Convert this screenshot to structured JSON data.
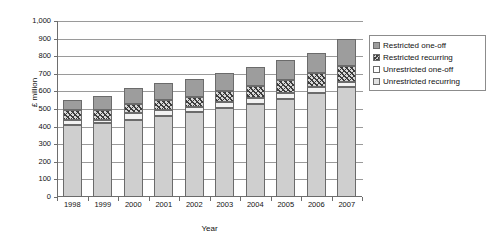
{
  "chart_data": {
    "type": "bar",
    "subtype": "stacked-bar",
    "title": "",
    "xlabel": "Year",
    "ylabel": "£ million",
    "ylim": [
      0,
      1000
    ],
    "ytick_step": 100,
    "grid": true,
    "legend_position": "right",
    "categories": [
      "1998",
      "1999",
      "2000",
      "2001",
      "2002",
      "2003",
      "2004",
      "2005",
      "2006",
      "2007"
    ],
    "ytick_labels": [
      "0",
      "100",
      "200",
      "300",
      "400",
      "500",
      "600",
      "700",
      "800",
      "900",
      "1,000"
    ],
    "series": [
      {
        "name": "Unrestricted recurring",
        "color": "#cfcfcf",
        "values": [
          410,
          418,
          440,
          460,
          482,
          508,
          530,
          555,
          592,
          625
        ]
      },
      {
        "name": "Unrestricted one-off",
        "color": "#f2f2f2",
        "values": [
          30,
          22,
          35,
          32,
          28,
          30,
          32,
          38,
          35,
          30
        ]
      },
      {
        "name": "Restricted recurring",
        "color": "#3d3d3d",
        "values": [
          55,
          55,
          55,
          58,
          60,
          62,
          68,
          72,
          78,
          92
        ]
      },
      {
        "name": "Restricted one-off",
        "color": "#9d9d9d",
        "values": [
          55,
          80,
          92,
          100,
          102,
          105,
          110,
          113,
          115,
          153
        ]
      }
    ],
    "totals": [
      550,
      575,
      622,
      650,
      672,
      705,
      740,
      778,
      820,
      900
    ]
  },
  "legend": {
    "items": [
      {
        "label": "Restricted one-off",
        "swatch": "restricted-oneoff-swatch"
      },
      {
        "label": "Restricted recurring",
        "swatch": "restricted-recurring-swatch"
      },
      {
        "label": "Unrestricted one-off",
        "swatch": "unrestricted-oneoff-swatch"
      },
      {
        "label": "Unrestricted recurring",
        "swatch": "unrestricted-recurring-swatch"
      }
    ]
  }
}
